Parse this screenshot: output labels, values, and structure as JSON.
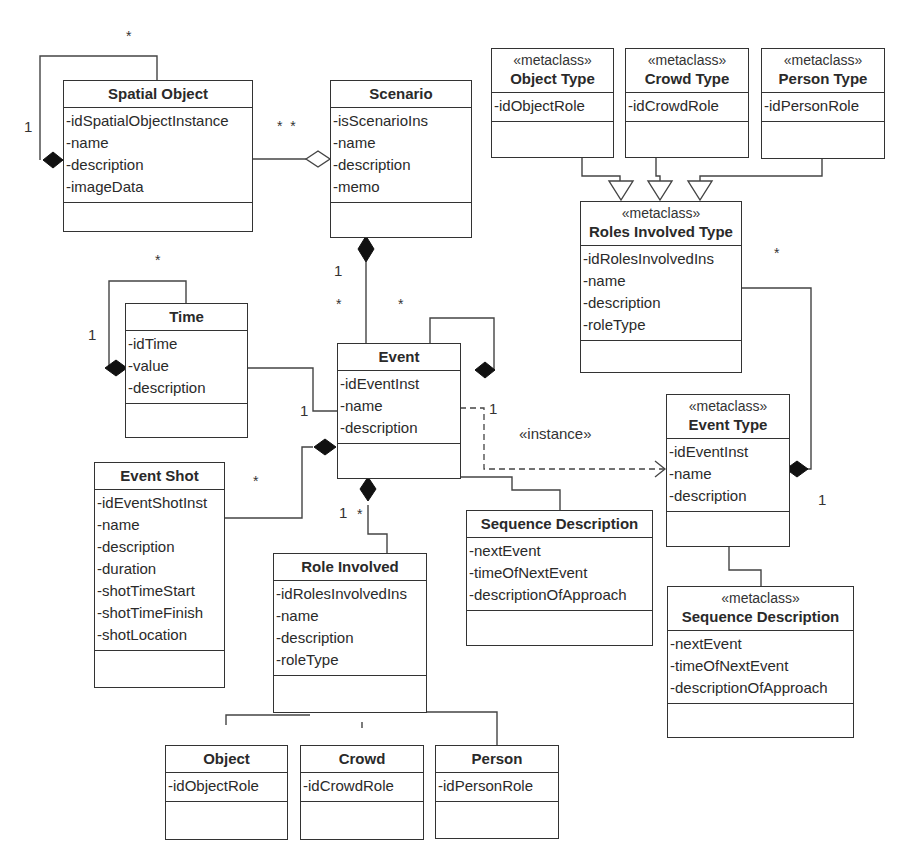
{
  "classes": {
    "spatial_object": {
      "name": "Spatial Object",
      "stereotype": "",
      "attributes": [
        "-idSpatialObjectInstance",
        "-name",
        "-description",
        "-imageData"
      ]
    },
    "scenario": {
      "name": "Scenario",
      "stereotype": "",
      "attributes": [
        "-isScenarioIns",
        "-name",
        "-description",
        "-memo"
      ]
    },
    "object_type": {
      "name": "Object Type",
      "stereotype": "«metaclass»",
      "attributes": [
        "-idObjectRole"
      ]
    },
    "crowd_type": {
      "name": "Crowd Type",
      "stereotype": "«metaclass»",
      "attributes": [
        "-idCrowdRole"
      ]
    },
    "person_type": {
      "name": "Person Type",
      "stereotype": "«metaclass»",
      "attributes": [
        "-idPersonRole"
      ]
    },
    "roles_involved_type": {
      "name": "Roles Involved Type",
      "stereotype": "«metaclass»",
      "attributes": [
        "-idRolesInvolvedIns",
        "-name",
        "-description",
        "-roleType"
      ]
    },
    "time": {
      "name": "Time",
      "stereotype": "",
      "attributes": [
        "-idTime",
        "-value",
        "-description"
      ]
    },
    "event": {
      "name": "Event",
      "stereotype": "",
      "attributes": [
        "-idEventInst",
        "-name",
        "-description"
      ]
    },
    "event_type": {
      "name": "Event Type",
      "stereotype": "«metaclass»",
      "attributes": [
        "-idEventInst",
        "-name",
        "-description"
      ]
    },
    "event_shot": {
      "name": "Event Shot",
      "stereotype": "",
      "attributes": [
        "-idEventShotInst",
        "-name",
        "-description",
        "-duration",
        "-shotTimeStart",
        "-shotTimeFinish",
        "-shotLocation"
      ]
    },
    "role_involved": {
      "name": "Role Involved",
      "stereotype": "",
      "attributes": [
        "-idRolesInvolvedIns",
        "-name",
        "-description",
        "-roleType"
      ]
    },
    "sequence_description": {
      "name": "Sequence Description",
      "stereotype": "",
      "attributes": [
        "-nextEvent",
        "-timeOfNextEvent",
        "-descriptionOfApproach"
      ]
    },
    "sequence_description_meta": {
      "name": "Sequence Description",
      "stereotype": "«metaclass»",
      "attributes": [
        "-nextEvent",
        "-timeOfNextEvent",
        "-descriptionOfApproach"
      ]
    },
    "object": {
      "name": "Object",
      "stereotype": "",
      "attributes": [
        "-idObjectRole"
      ]
    },
    "crowd": {
      "name": "Crowd",
      "stereotype": "",
      "attributes": [
        "-idCrowdRole"
      ]
    },
    "person": {
      "name": "Person",
      "stereotype": "",
      "attributes": [
        "-idPersonRole"
      ]
    }
  },
  "labels": {
    "spatial_self_star": "*",
    "spatial_self_one": "1",
    "spatial_scenario_stars": "*  *",
    "scenario_event_one": "1",
    "scenario_event_star": "*",
    "event_self_star": "*",
    "time_self_star": "*",
    "time_self_one": "1",
    "time_event_one": "1",
    "event_instance_one": "1",
    "instance_stereotype": "«instance»",
    "eventshot_star": "*",
    "role_event_one": "1",
    "role_event_star": "*",
    "roles_type_star": "*",
    "event_type_one": "1"
  }
}
